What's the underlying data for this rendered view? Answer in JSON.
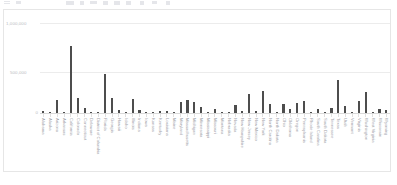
{
  "toolbar": {
    "items": [
      {
        "label": "≡",
        "x": 2
      },
      {
        "label": "⎘",
        "x": 14
      },
      {
        "label": "▤",
        "x": 64
      },
      {
        "label": "▦",
        "x": 80
      },
      {
        "label": "─",
        "x": 96
      },
      {
        "label": "△",
        "x": 112
      },
      {
        "label": "▭",
        "x": 128
      },
      {
        "label": "⚙",
        "x": 150
      },
      {
        "label": "◎",
        "x": 166
      },
      {
        "label": "⌘",
        "x": 182
      }
    ]
  },
  "chart_data": {
    "type": "bar",
    "title": "",
    "xlabel": "",
    "ylabel": "",
    "ylim": [
      0,
      1000000
    ],
    "yticks": [
      0,
      500000,
      1000000
    ],
    "ytick_labels": [
      "0",
      "500,000",
      "1,000,000"
    ],
    "grid": true,
    "legend": "none",
    "bar_color": "#4d4d4d",
    "categories": [
      "Alabama",
      "Alaska",
      "Arizona",
      "Arkansas",
      "California",
      "Colorado",
      "Connecticut",
      "Delaware",
      "District of Columbia",
      "Florida",
      "Georgia",
      "Hawaii",
      "Idaho",
      "Illinois",
      "Indiana",
      "Iowa",
      "Kansas",
      "Kentucky",
      "Louisiana",
      "Maine",
      "Maryland",
      "Massachusetts",
      "Michigan",
      "Minnesota",
      "Mississippi",
      "Missouri",
      "Montana",
      "Nebraska",
      "Nevada",
      "New Hampshire",
      "New Jersey",
      "New Mexico",
      "New York",
      "North Carolina",
      "North Dakota",
      "Ohio",
      "Oklahoma",
      "Oregon",
      "Pennsylvania",
      "Rhode Island",
      "South Carolina",
      "South Dakota",
      "Tennessee",
      "Texas",
      "Utah",
      "Vermont",
      "Virginia",
      "Washington",
      "West Virginia",
      "Wisconsin",
      "Wyoming"
    ],
    "values": [
      18000,
      6000,
      150000,
      14000,
      750000,
      170000,
      60000,
      10000,
      8000,
      430000,
      165000,
      35000,
      12000,
      160000,
      30000,
      10000,
      12000,
      20000,
      22000,
      8000,
      125000,
      140000,
      120000,
      70000,
      8000,
      45000,
      6000,
      6000,
      90000,
      20000,
      215000,
      22000,
      240000,
      100000,
      6000,
      95000,
      48000,
      110000,
      130000,
      12000,
      40000,
      6000,
      60000,
      370000,
      75000,
      10000,
      130000,
      230000,
      8000,
      48000,
      30000
    ]
  }
}
